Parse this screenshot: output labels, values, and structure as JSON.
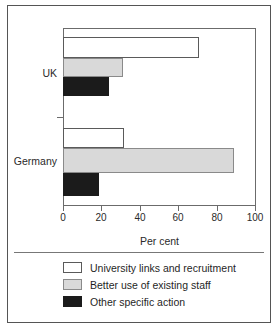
{
  "chart_data": {
    "type": "bar",
    "orientation": "horizontal",
    "title": "",
    "xlabel": "Per cent",
    "ylabel": "",
    "xlim": [
      0,
      100
    ],
    "xticks": [
      0,
      20,
      40,
      60,
      80,
      100
    ],
    "xtick_labels": [
      "0",
      "20",
      "40",
      "60",
      "80",
      "100"
    ],
    "grid": false,
    "legend_position": "bottom-left",
    "categories": [
      "UK",
      "Germany"
    ],
    "series": [
      {
        "name": "University links and recruitment",
        "color": "#ffffff",
        "values": [
          71,
          32
        ]
      },
      {
        "name": "Better use of existing staff",
        "color": "#d9d9d9",
        "values": [
          31,
          89
        ]
      },
      {
        "name": "Other specific action",
        "color": "#1b1b1b",
        "values": [
          24,
          19
        ]
      }
    ],
    "annotations": []
  },
  "axis": {
    "x_title": "Per cent",
    "ticks": [
      {
        "label": "0",
        "value": 0
      },
      {
        "label": "20",
        "value": 20
      },
      {
        "label": "40",
        "value": 40
      },
      {
        "label": "60",
        "value": 60
      },
      {
        "label": "80",
        "value": 80
      },
      {
        "label": "100",
        "value": 100
      }
    ]
  },
  "categories": [
    {
      "label": "UK"
    },
    {
      "label": "Germany"
    }
  ],
  "legend": {
    "items": [
      {
        "label": "University links and recruitment",
        "swatch": "white"
      },
      {
        "label": "Better use of existing staff",
        "swatch": "gray"
      },
      {
        "label": "Other specific action",
        "swatch": "black"
      }
    ]
  }
}
